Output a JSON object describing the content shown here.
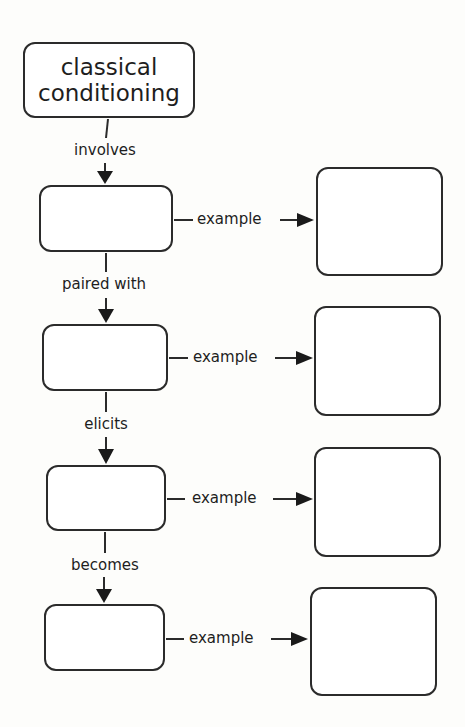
{
  "diagram": {
    "title_node": {
      "line1": "classical",
      "line2": "conditioning"
    },
    "vertical_links": [
      {
        "label": "involves"
      },
      {
        "label": "paired with"
      },
      {
        "label": "elicits"
      },
      {
        "label": "becomes"
      }
    ],
    "rows": [
      {
        "concept_box": "",
        "link_label": "example",
        "example_box": ""
      },
      {
        "concept_box": "",
        "link_label": "example",
        "example_box": ""
      },
      {
        "concept_box": "",
        "link_label": "example",
        "example_box": ""
      },
      {
        "concept_box": "",
        "link_label": "example",
        "example_box": ""
      }
    ],
    "colors": {
      "stroke": "#2b2b2b",
      "background": "#fdfdfb",
      "text": "#1e1e1e"
    }
  }
}
